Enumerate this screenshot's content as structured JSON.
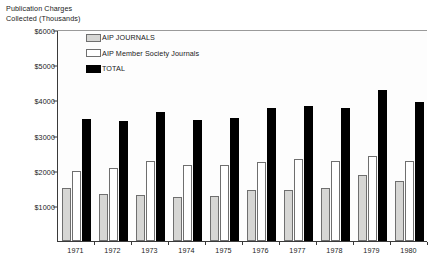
{
  "chart_data": {
    "type": "bar",
    "title": "Publication Charges Collected (Thousands)",
    "title_line1": "Publication Charges",
    "title_line2": "Collected (Thousands)",
    "xlabel": "",
    "ylabel": "",
    "grid": false,
    "legend_position": "top-left-inside",
    "ylim": [
      0,
      6000
    ],
    "yticks": [
      1000,
      2000,
      3000,
      4000,
      5000,
      6000
    ],
    "ytick_labels": [
      "$1000",
      "$2000",
      "$3000",
      "$4000",
      "$5000",
      "$6000"
    ],
    "categories": [
      "1971",
      "1972",
      "1973",
      "1974",
      "1975",
      "1976",
      "1977",
      "1978",
      "1979",
      "1980"
    ],
    "series": [
      {
        "name": "AIP JOURNALS",
        "color": "#d6d6d4",
        "values": [
          1500,
          1330,
          1320,
          1260,
          1290,
          1440,
          1450,
          1520,
          1870,
          1720
        ]
      },
      {
        "name": "AIP Member Society Journals",
        "color": "#ffffff",
        "values": [
          1980,
          2080,
          2280,
          2170,
          2150,
          2250,
          2330,
          2270,
          2420,
          2280
        ]
      },
      {
        "name": "TOTAL",
        "color": "#000000",
        "values": [
          3460,
          3400,
          3680,
          3450,
          3510,
          3780,
          3830,
          3780,
          4300,
          3960
        ]
      }
    ]
  }
}
